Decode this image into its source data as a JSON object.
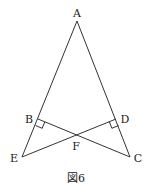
{
  "figure": {
    "caption": "図6",
    "stroke_color": "#333333",
    "background": "#ffffff"
  },
  "points": {
    "A": {
      "label": "A",
      "x": 77,
      "y": 21
    },
    "B": {
      "label": "B",
      "x": 38,
      "y": 119
    },
    "D": {
      "label": "D",
      "x": 116,
      "y": 119
    },
    "E": {
      "label": "E",
      "x": 22,
      "y": 157
    },
    "C": {
      "label": "C",
      "x": 130,
      "y": 157
    },
    "F": {
      "label": "F",
      "x": 76,
      "y": 137
    }
  },
  "segments": [
    {
      "from": "A",
      "to": "E"
    },
    {
      "from": "A",
      "to": "C"
    },
    {
      "from": "B",
      "to": "C"
    },
    {
      "from": "D",
      "to": "E"
    }
  ],
  "right_angles": [
    {
      "at": "B",
      "between": [
        "A",
        "C"
      ]
    },
    {
      "at": "D",
      "between": [
        "A",
        "E"
      ]
    }
  ]
}
